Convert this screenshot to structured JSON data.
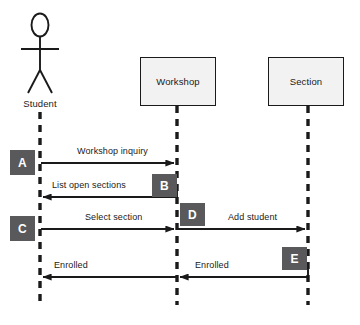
{
  "diagram": {
    "type": "uml-sequence-diagram",
    "actor": {
      "name": "Student",
      "label": "Student",
      "icon": "stick-figure-actor-icon",
      "lifeline_x": 40
    },
    "participants": [
      {
        "id": "workshop",
        "label": "Workshop",
        "lifeline_x": 177,
        "box": {
          "x": 140,
          "y": 57,
          "w": 76,
          "h": 49
        }
      },
      {
        "id": "section",
        "label": "Section",
        "lifeline_x": 308,
        "box": {
          "x": 268,
          "y": 57,
          "w": 76,
          "h": 49
        }
      }
    ],
    "messages": [
      {
        "step": "A",
        "label": "Workshop inquiry",
        "from": "Student",
        "to": "Workshop",
        "direction": "right"
      },
      {
        "step": "B",
        "label": "List open sections",
        "from": "Workshop",
        "to": "Student",
        "direction": "left"
      },
      {
        "step": "C",
        "label": "Select section",
        "from": "Student",
        "to": "Workshop",
        "direction": "right"
      },
      {
        "step": "D",
        "label": "Add student",
        "from": "Workshop",
        "to": "Section",
        "direction": "right"
      },
      {
        "step": "E",
        "label": "Enrolled",
        "from": "Section",
        "to": "Workshop",
        "direction": "left"
      },
      {
        "step": "E",
        "label": "Enrolled",
        "from": "Workshop",
        "to": "Student",
        "direction": "left"
      }
    ],
    "badges": [
      {
        "letter": "A",
        "x": 10,
        "y": 150,
        "w": 25,
        "h": 25
      },
      {
        "letter": "B",
        "x": 152,
        "y": 174,
        "w": 25,
        "h": 23
      },
      {
        "letter": "C",
        "x": 10,
        "y": 216,
        "w": 25,
        "h": 25
      },
      {
        "letter": "D",
        "x": 180,
        "y": 203,
        "w": 25,
        "h": 23
      },
      {
        "letter": "E",
        "x": 282,
        "y": 247,
        "w": 25,
        "h": 23
      }
    ],
    "colors": {
      "badge_fill": "#59595b",
      "badge_text": "#ffffff",
      "box_fill": "#f2f2f2",
      "stroke": "#1a1a1a",
      "background": "#ffffff"
    }
  }
}
